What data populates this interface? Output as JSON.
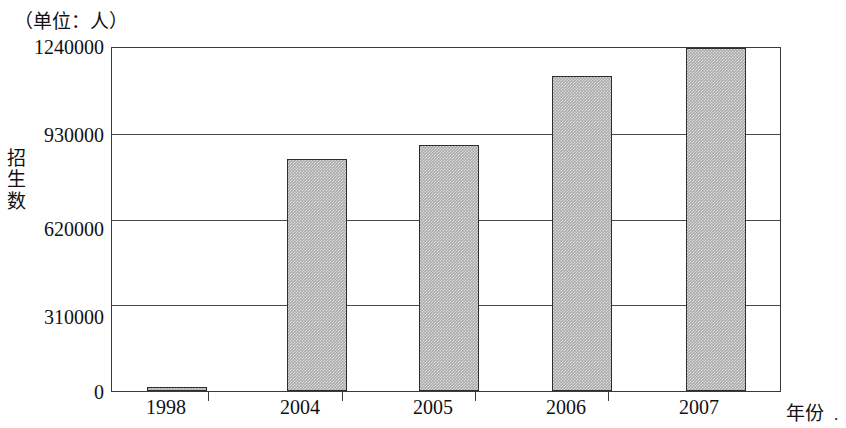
{
  "unit_caption": "（单位：人）",
  "y_axis_title_chars": [
    "招",
    "生",
    "数"
  ],
  "x_axis_title": "年份",
  "x_axis_title_suffix": ".",
  "colors": {
    "bar_fill": "#aaaaaa",
    "bar_border": "#2e2e2e",
    "axis": "#3b3b3b",
    "text": "#111111",
    "background": "#ffffff"
  },
  "chart_data": {
    "type": "bar",
    "title": "（单位：人）",
    "xlabel": "年份",
    "ylabel": "招生数",
    "categories": [
      "1998",
      "2004",
      "2005",
      "2006",
      "2007"
    ],
    "values": [
      13000,
      840000,
      890000,
      1140000,
      1240000
    ],
    "yticks": [
      "0",
      "310000",
      "620000",
      "930000",
      "1240000"
    ],
    "ytick_values": [
      0,
      310000,
      620000,
      930000,
      1240000
    ],
    "ylim": [
      0,
      1240000
    ],
    "grid": true,
    "legend": "none",
    "series": [
      {
        "name": "招生数",
        "values": [
          13000,
          840000,
          890000,
          1140000,
          1240000
        ]
      }
    ]
  }
}
